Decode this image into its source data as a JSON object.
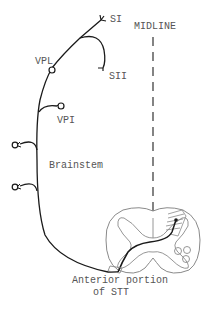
{
  "diagram": {
    "type": "neuroanatomy pathway diagram",
    "labels": {
      "si": "SI",
      "sii": "SII",
      "midline": "MIDLINE",
      "vpl": "VPL",
      "vpi": "VPI",
      "brainstem": "Brainstem",
      "anterior_line1": "Anterior portion",
      "anterior_line2": "of STT"
    },
    "colors": {
      "stroke": "#1a1a1a",
      "cord_outline": "#8a8a8a",
      "label_text": "#555555",
      "background": "#ffffff"
    }
  }
}
